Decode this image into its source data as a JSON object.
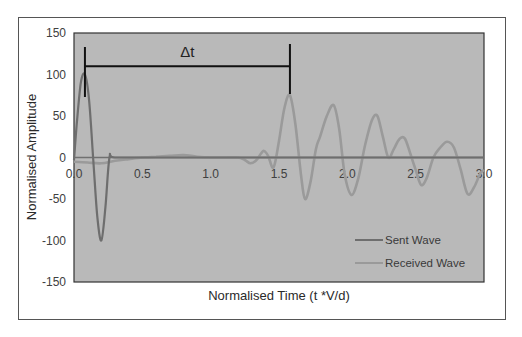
{
  "chart_data": {
    "type": "line",
    "title": "",
    "xlabel": "Normalised Time (t *V/d)",
    "ylabel": "Normalised Amplitude",
    "xlim": [
      0,
      3.0
    ],
    "ylim": [
      -150,
      150
    ],
    "x_ticks": [
      "0.0",
      "0.5",
      "1.0",
      "1.5",
      "2.0",
      "2.5",
      "3.0"
    ],
    "y_ticks": [
      "150",
      "100",
      "50",
      "0",
      "-50",
      "-100",
      "-150"
    ],
    "grid": false,
    "legend_position": "lower right",
    "plot_background": "#b9b9b9",
    "series": [
      {
        "name": "Sent Wave",
        "color": "#6e6e6e",
        "x": [
          0.0,
          0.02,
          0.05,
          0.08,
          0.11,
          0.14,
          0.17,
          0.2,
          0.23,
          0.26,
          0.3,
          0.6,
          1.0,
          1.5,
          2.0,
          2.5,
          3.0
        ],
        "values": [
          -3,
          40,
          90,
          100,
          70,
          0,
          -70,
          -100,
          -60,
          0,
          0,
          0,
          0,
          0,
          0,
          0,
          0
        ]
      },
      {
        "name": "Received Wave",
        "color": "#9a9a9a",
        "x": [
          0.0,
          0.1,
          0.2,
          0.3,
          0.4,
          0.5,
          0.6,
          0.7,
          0.8,
          0.9,
          1.0,
          1.1,
          1.2,
          1.25,
          1.29,
          1.33,
          1.37,
          1.39,
          1.42,
          1.46,
          1.5,
          1.54,
          1.58,
          1.62,
          1.66,
          1.69,
          1.73,
          1.77,
          1.8,
          1.85,
          1.9,
          1.94,
          1.98,
          2.03,
          2.08,
          2.13,
          2.18,
          2.22,
          2.26,
          2.3,
          2.34,
          2.38,
          2.42,
          2.46,
          2.5,
          2.54,
          2.58,
          2.63,
          2.68,
          2.73,
          2.78,
          2.83,
          2.88,
          2.93,
          2.97,
          3.0
        ],
        "values": [
          -5,
          -6,
          -7,
          -4,
          -2,
          0,
          1,
          2,
          3,
          1,
          0,
          0,
          0,
          -3,
          -7,
          -4,
          5,
          8,
          2,
          -12,
          20,
          60,
          75,
          40,
          -20,
          -50,
          -30,
          10,
          25,
          50,
          63,
          35,
          -20,
          -45,
          -25,
          15,
          45,
          50,
          25,
          0,
          10,
          22,
          23,
          5,
          -15,
          -33,
          -25,
          0,
          12,
          19,
          12,
          -15,
          -44,
          -35,
          -20,
          -15
        ]
      }
    ],
    "annotations": [
      {
        "type": "double-bracket",
        "label": "Δt",
        "x_start": 0.08,
        "x_end": 1.58,
        "y": 110
      }
    ]
  },
  "legend": {
    "items": [
      {
        "label": "Sent Wave",
        "color": "#6e6e6e"
      },
      {
        "label": "Received Wave",
        "color": "#9a9a9a"
      }
    ]
  },
  "annotation": {
    "label": "Δt"
  }
}
